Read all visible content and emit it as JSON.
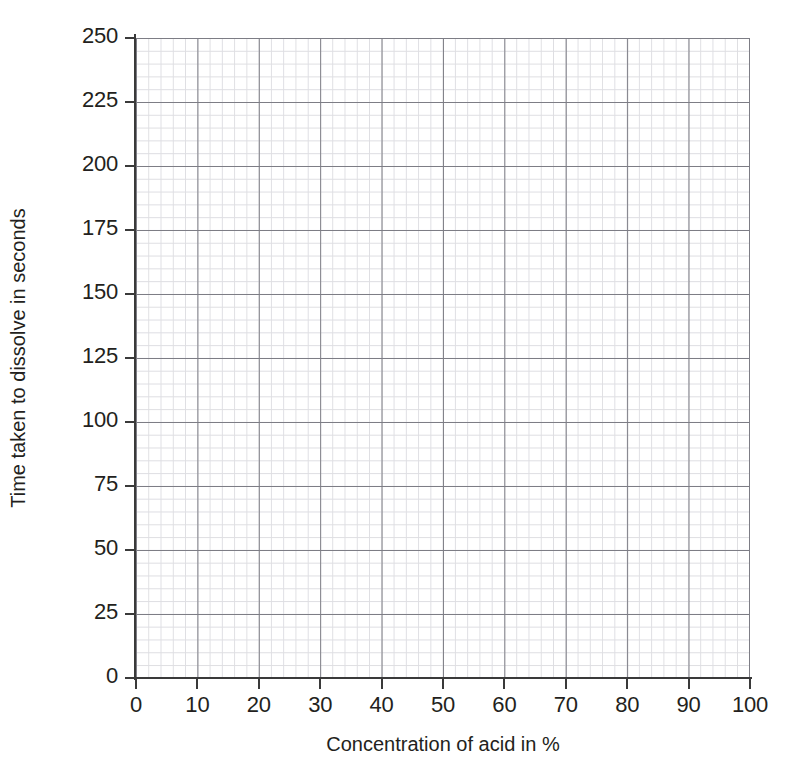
{
  "chart_data": {
    "type": "line",
    "title": "",
    "subtitle": "",
    "xlabel": "Concentration of acid in %",
    "ylabel": "Time taken to dissolve in seconds",
    "xlim": [
      0,
      100
    ],
    "ylim": [
      0,
      250
    ],
    "x_major_step": 10,
    "y_major_step": 25,
    "x_minor_divisions_per_major": 5,
    "y_minor_divisions_per_major": 5,
    "x_ticks": [
      0,
      10,
      20,
      30,
      40,
      50,
      60,
      70,
      80,
      90,
      100
    ],
    "y_ticks": [
      0,
      25,
      50,
      75,
      100,
      125,
      150,
      175,
      200,
      225,
      250
    ],
    "x_ticklabels": [
      "0",
      "10",
      "20",
      "30",
      "40",
      "50",
      "60",
      "70",
      "80",
      "90",
      "100"
    ],
    "y_ticklabels": [
      "0",
      "25",
      "50",
      "75",
      "100",
      "125",
      "150",
      "175",
      "200",
      "225",
      "250"
    ],
    "grid": true,
    "minor_grid": true,
    "legend": false,
    "legend_position": "none",
    "annotations": [],
    "series": [],
    "values": [],
    "categories": [],
    "note": "Blank graph paper grid provided for plotting; no data points are drawn."
  },
  "colors": {
    "background": "#ffffff",
    "axis": "#3a3a3a",
    "major_grid": "#7d7d85",
    "minor_grid": "#d9d9de",
    "text": "#231f20"
  }
}
